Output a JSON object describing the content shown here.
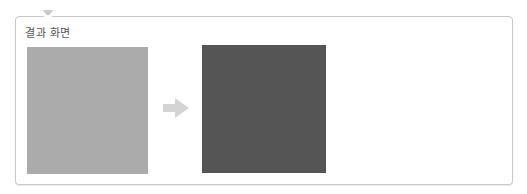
{
  "panel": {
    "title": "결과 화면"
  },
  "images": {
    "before": {
      "label": "before-image",
      "color": "#ababab"
    },
    "after": {
      "label": "after-image",
      "color": "#555555"
    }
  },
  "arrow": {
    "icon": "arrow-right-icon",
    "color": "#d4d4d4"
  },
  "colors": {
    "border": "#c8c8c8",
    "title": "#555555"
  }
}
